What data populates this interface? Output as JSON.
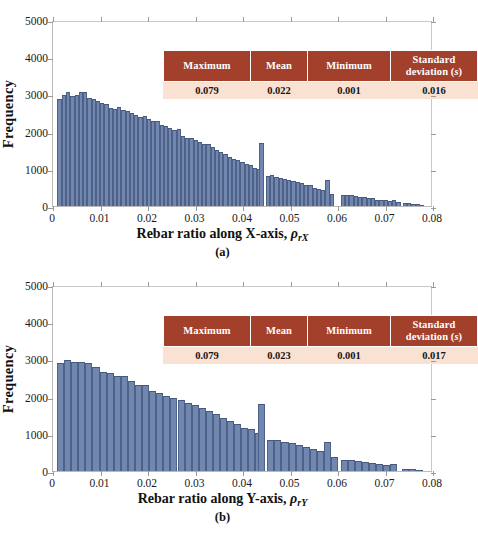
{
  "figure": {
    "background": "#ffffff",
    "bar_color": "#7187af",
    "bar_edge_color": "#4e6287",
    "table_header_color": "#A3402B",
    "table_body_color": "#FAE2D3",
    "axis_color": "#b9b9b9"
  },
  "stats_table": {
    "headers": [
      "Maximum",
      "Mean",
      "Minimum",
      "Standard deviation ("
    ],
    "header_sd_prefix": "Standard",
    "header_sd_line2": "deviation (",
    "header_sd_symbol": "s",
    "header_sd_suffix": ")"
  },
  "panels": [
    {
      "id": "a",
      "caption": "(a)",
      "xlabel_main": "Rebar ratio along X-axis, ",
      "xlabel_rho": "ρ",
      "xlabel_sub": "rX",
      "ylabel": "Frequency",
      "stats": {
        "headers": [
          "Maximum",
          "Mean",
          "Minimum",
          "Standard deviation (s)"
        ],
        "values": [
          "0.079",
          "0.022",
          "0.001",
          "0.016"
        ]
      }
    },
    {
      "id": "b",
      "caption": "(b)",
      "xlabel_main": "Rebar ratio along Y-axis, ",
      "xlabel_rho": "ρ",
      "xlabel_sub": "rY",
      "ylabel": "Frequency",
      "stats": {
        "headers": [
          "Maximum",
          "Mean",
          "Minimum",
          "Standard deviation (s)"
        ],
        "values": [
          "0.079",
          "0.023",
          "0.001",
          "0.017"
        ]
      }
    }
  ],
  "chart_data": [
    {
      "type": "bar",
      "title": "",
      "panel": "(a)",
      "xlabel": "Rebar ratio along X-axis, ρrX",
      "ylabel": "Frequency",
      "xlim": [
        0,
        0.08
      ],
      "ylim": [
        0,
        5000
      ],
      "xticks": [
        0,
        0.01,
        0.02,
        0.03,
        0.04,
        0.05,
        0.06,
        0.07,
        0.08
      ],
      "xticklabels": [
        "0",
        "0.01",
        "0.02",
        "0.03",
        "0.04",
        "0.05",
        "0.06",
        "0.07",
        "0.08"
      ],
      "yticks": [
        0,
        1000,
        2000,
        3000,
        4000,
        5000
      ],
      "yticklabels": [
        "0",
        "1000",
        "2000",
        "3000",
        "4000",
        "5000"
      ],
      "grid": false,
      "legend": null,
      "bin_width": 0.0009,
      "bins": [
        {
          "x": 0.0014,
          "v": 2920
        },
        {
          "x": 0.0023,
          "v": 3020
        },
        {
          "x": 0.0032,
          "v": 3090
        },
        {
          "x": 0.0041,
          "v": 2990
        },
        {
          "x": 0.005,
          "v": 3010
        },
        {
          "x": 0.0059,
          "v": 3095
        },
        {
          "x": 0.0068,
          "v": 3085
        },
        {
          "x": 0.0077,
          "v": 2925
        },
        {
          "x": 0.0086,
          "v": 2905
        },
        {
          "x": 0.0095,
          "v": 2865
        },
        {
          "x": 0.0104,
          "v": 2790
        },
        {
          "x": 0.0113,
          "v": 2770
        },
        {
          "x": 0.0122,
          "v": 2670
        },
        {
          "x": 0.0131,
          "v": 2640
        },
        {
          "x": 0.014,
          "v": 2700
        },
        {
          "x": 0.0149,
          "v": 2615
        },
        {
          "x": 0.0158,
          "v": 2580
        },
        {
          "x": 0.0167,
          "v": 2530
        },
        {
          "x": 0.0176,
          "v": 2470
        },
        {
          "x": 0.0185,
          "v": 2430
        },
        {
          "x": 0.0194,
          "v": 2440
        },
        {
          "x": 0.0203,
          "v": 2355
        },
        {
          "x": 0.0212,
          "v": 2310
        },
        {
          "x": 0.0221,
          "v": 2300
        },
        {
          "x": 0.023,
          "v": 2215
        },
        {
          "x": 0.0239,
          "v": 2180
        },
        {
          "x": 0.0248,
          "v": 2110
        },
        {
          "x": 0.0257,
          "v": 2055
        },
        {
          "x": 0.0266,
          "v": 2090
        },
        {
          "x": 0.0275,
          "v": 1900
        },
        {
          "x": 0.0284,
          "v": 1845
        },
        {
          "x": 0.0293,
          "v": 1835
        },
        {
          "x": 0.0302,
          "v": 1800
        },
        {
          "x": 0.0311,
          "v": 1740
        },
        {
          "x": 0.032,
          "v": 1690
        },
        {
          "x": 0.0329,
          "v": 1680
        },
        {
          "x": 0.0338,
          "v": 1610
        },
        {
          "x": 0.0347,
          "v": 1530
        },
        {
          "x": 0.0356,
          "v": 1480
        },
        {
          "x": 0.0365,
          "v": 1420
        },
        {
          "x": 0.0374,
          "v": 1340
        },
        {
          "x": 0.0383,
          "v": 1280
        },
        {
          "x": 0.0392,
          "v": 1260
        },
        {
          "x": 0.0401,
          "v": 1190
        },
        {
          "x": 0.041,
          "v": 1150
        },
        {
          "x": 0.0419,
          "v": 1110
        },
        {
          "x": 0.0428,
          "v": 1035
        },
        {
          "x": 0.0437,
          "v": 1000
        },
        {
          "x": 0.0441,
          "v": 1710
        },
        {
          "x": 0.0455,
          "v": 820
        },
        {
          "x": 0.0464,
          "v": 830
        },
        {
          "x": 0.0473,
          "v": 790
        },
        {
          "x": 0.0482,
          "v": 760
        },
        {
          "x": 0.0491,
          "v": 745
        },
        {
          "x": 0.05,
          "v": 700
        },
        {
          "x": 0.0509,
          "v": 680
        },
        {
          "x": 0.0518,
          "v": 650
        },
        {
          "x": 0.0527,
          "v": 620
        },
        {
          "x": 0.0536,
          "v": 580
        },
        {
          "x": 0.0545,
          "v": 560
        },
        {
          "x": 0.0554,
          "v": 500
        },
        {
          "x": 0.0563,
          "v": 455
        },
        {
          "x": 0.0572,
          "v": 430
        },
        {
          "x": 0.0581,
          "v": 715
        },
        {
          "x": 0.059,
          "v": 340
        },
        {
          "x": 0.0614,
          "v": 305
        },
        {
          "x": 0.0623,
          "v": 300
        },
        {
          "x": 0.0632,
          "v": 290
        },
        {
          "x": 0.0641,
          "v": 265
        },
        {
          "x": 0.065,
          "v": 245
        },
        {
          "x": 0.0659,
          "v": 235
        },
        {
          "x": 0.0668,
          "v": 215
        },
        {
          "x": 0.0677,
          "v": 205
        },
        {
          "x": 0.0686,
          "v": 175
        },
        {
          "x": 0.0695,
          "v": 165
        },
        {
          "x": 0.0704,
          "v": 150
        },
        {
          "x": 0.0713,
          "v": 140
        },
        {
          "x": 0.0722,
          "v": 165
        },
        {
          "x": 0.0731,
          "v": 100
        },
        {
          "x": 0.0745,
          "v": 80
        },
        {
          "x": 0.0754,
          "v": 70
        },
        {
          "x": 0.0763,
          "v": 60
        },
        {
          "x": 0.0772,
          "v": 45
        },
        {
          "x": 0.0781,
          "v": 35
        }
      ]
    },
    {
      "type": "bar",
      "title": "",
      "panel": "(b)",
      "xlabel": "Rebar ratio along Y-axis, ρrY",
      "ylabel": "Frequency",
      "xlim": [
        0,
        0.08
      ],
      "ylim": [
        0,
        5000
      ],
      "xticks": [
        0,
        0.01,
        0.02,
        0.03,
        0.04,
        0.05,
        0.06,
        0.07,
        0.08
      ],
      "xticklabels": [
        "0",
        "0.01",
        "0.02",
        "0.03",
        "0.04",
        "0.05",
        "0.06",
        "0.07",
        "0.08"
      ],
      "yticks": [
        0,
        1000,
        2000,
        3000,
        4000,
        5000
      ],
      "yticklabels": [
        "0",
        "1000",
        "2000",
        "3000",
        "4000",
        "5000"
      ],
      "grid": false,
      "legend": null,
      "bin_width": 0.0015,
      "bins": [
        {
          "x": 0.0016,
          "v": 2940
        },
        {
          "x": 0.0031,
          "v": 3030
        },
        {
          "x": 0.0046,
          "v": 2970
        },
        {
          "x": 0.0061,
          "v": 2960
        },
        {
          "x": 0.0076,
          "v": 2930
        },
        {
          "x": 0.0091,
          "v": 2830
        },
        {
          "x": 0.0106,
          "v": 2690
        },
        {
          "x": 0.0121,
          "v": 2650
        },
        {
          "x": 0.0136,
          "v": 2580
        },
        {
          "x": 0.0151,
          "v": 2570
        },
        {
          "x": 0.0166,
          "v": 2450
        },
        {
          "x": 0.0181,
          "v": 2330
        },
        {
          "x": 0.0196,
          "v": 2350
        },
        {
          "x": 0.0211,
          "v": 2180
        },
        {
          "x": 0.0226,
          "v": 2130
        },
        {
          "x": 0.0241,
          "v": 2050
        },
        {
          "x": 0.0256,
          "v": 1990
        },
        {
          "x": 0.0271,
          "v": 1920
        },
        {
          "x": 0.0286,
          "v": 1860
        },
        {
          "x": 0.0301,
          "v": 1800
        },
        {
          "x": 0.0316,
          "v": 1720
        },
        {
          "x": 0.0331,
          "v": 1620
        },
        {
          "x": 0.0346,
          "v": 1540
        },
        {
          "x": 0.0361,
          "v": 1430
        },
        {
          "x": 0.0376,
          "v": 1350
        },
        {
          "x": 0.0391,
          "v": 1290
        },
        {
          "x": 0.0406,
          "v": 1180
        },
        {
          "x": 0.0421,
          "v": 1130
        },
        {
          "x": 0.0436,
          "v": 1040
        },
        {
          "x": 0.0442,
          "v": 1830
        },
        {
          "x": 0.0461,
          "v": 830
        },
        {
          "x": 0.0476,
          "v": 855
        },
        {
          "x": 0.0491,
          "v": 790
        },
        {
          "x": 0.0506,
          "v": 760
        },
        {
          "x": 0.0521,
          "v": 720
        },
        {
          "x": 0.0536,
          "v": 650
        },
        {
          "x": 0.0551,
          "v": 590
        },
        {
          "x": 0.0566,
          "v": 550
        },
        {
          "x": 0.0581,
          "v": 800
        },
        {
          "x": 0.0596,
          "v": 370
        },
        {
          "x": 0.0616,
          "v": 310
        },
        {
          "x": 0.0631,
          "v": 300
        },
        {
          "x": 0.0646,
          "v": 275
        },
        {
          "x": 0.0661,
          "v": 250
        },
        {
          "x": 0.0676,
          "v": 225
        },
        {
          "x": 0.0691,
          "v": 195
        },
        {
          "x": 0.0706,
          "v": 160
        },
        {
          "x": 0.0721,
          "v": 185
        },
        {
          "x": 0.0746,
          "v": 60
        },
        {
          "x": 0.0761,
          "v": 45
        },
        {
          "x": 0.0776,
          "v": 30
        }
      ]
    }
  ]
}
